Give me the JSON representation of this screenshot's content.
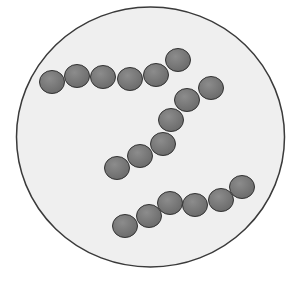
{
  "image": {
    "subject": "streptococci chains under microscope field",
    "colors": {
      "page_background": "#ffffff",
      "field_fill": "#efefef",
      "field_border": "#3a3a3a",
      "cell_fill": "#6c6c6c",
      "cell_highlight": "#8c8c8c",
      "cell_border": "#333333"
    },
    "field": {
      "cx": 150.5,
      "cy": 137,
      "rx": 134,
      "ry": 130
    },
    "chains": [
      {
        "name": "chain-top",
        "cells": [
          [
            52,
            82
          ],
          [
            77,
            76
          ],
          [
            103,
            77
          ],
          [
            130,
            79
          ],
          [
            156,
            75
          ],
          [
            178,
            60
          ]
        ]
      },
      {
        "name": "chain-middle",
        "cells": [
          [
            211,
            88
          ],
          [
            187,
            100
          ],
          [
            171,
            120
          ],
          [
            163,
            144
          ],
          [
            140,
            156
          ],
          [
            117,
            168
          ]
        ]
      },
      {
        "name": "chain-bottom",
        "cells": [
          [
            125,
            226
          ],
          [
            149,
            216
          ],
          [
            170,
            203
          ],
          [
            195,
            205
          ],
          [
            221,
            200
          ],
          [
            242,
            187
          ]
        ]
      }
    ],
    "cell_rx": 12.5,
    "cell_ry": 11.5
  }
}
